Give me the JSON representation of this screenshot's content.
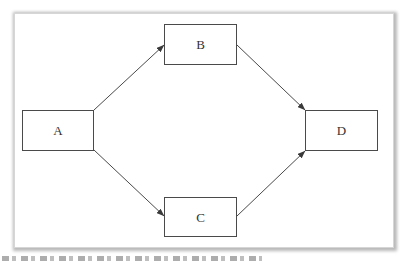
{
  "diagram": {
    "type": "flow",
    "colors": {
      "stroke": "#4a4a4a",
      "fill": "#ffffff",
      "text": "#333333",
      "frame_border": "#d6d6d6"
    },
    "nodes": [
      {
        "id": "A",
        "label": "A",
        "x": 22,
        "y": 110,
        "w": 72,
        "h": 40
      },
      {
        "id": "B",
        "label": "B",
        "x": 164,
        "y": 24,
        "w": 73,
        "h": 40
      },
      {
        "id": "C",
        "label": "C",
        "x": 164,
        "y": 197,
        "w": 73,
        "h": 40
      },
      {
        "id": "D",
        "label": "D",
        "x": 305,
        "y": 110,
        "w": 73,
        "h": 41
      }
    ],
    "edges": [
      {
        "from": "A",
        "to": "B"
      },
      {
        "from": "A",
        "to": "C"
      },
      {
        "from": "B",
        "to": "D"
      },
      {
        "from": "C",
        "to": "D"
      }
    ]
  }
}
